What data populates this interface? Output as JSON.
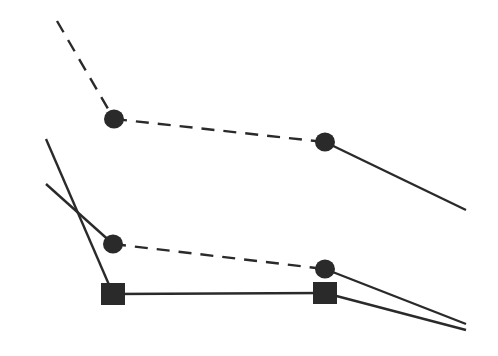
{
  "diagram": {
    "background": "#ffffff",
    "stroke_color": "#2a2a2a",
    "marker_color": "#2a2a2a",
    "stroke_width": 2.4,
    "dash_pattern": "13,9",
    "series": [
      {
        "name": "upper-circle-series",
        "marker": "circle",
        "segments": [
          {
            "from": [
              57,
              21
            ],
            "to": [
              114,
              119
            ],
            "style": "dashed"
          },
          {
            "from": [
              114,
              119
            ],
            "to": [
              325,
              142
            ],
            "style": "dashed"
          },
          {
            "from": [
              325,
              142
            ],
            "to": [
              466,
              210
            ],
            "style": "solid"
          }
        ],
        "markers": [
          [
            114,
            119
          ],
          [
            325,
            142
          ]
        ]
      },
      {
        "name": "lower-circle-series",
        "marker": "circle",
        "segments": [
          {
            "from": [
              46,
              184
            ],
            "to": [
              113,
              244
            ],
            "style": "solid"
          },
          {
            "from": [
              113,
              244
            ],
            "to": [
              325,
              269
            ],
            "style": "dashed"
          },
          {
            "from": [
              325,
              269
            ],
            "to": [
              466,
              324
            ],
            "style": "solid"
          }
        ],
        "markers": [
          [
            113,
            244
          ],
          [
            325,
            269
          ]
        ]
      },
      {
        "name": "square-series",
        "marker": "square",
        "segments": [
          {
            "from": [
              46,
              139
            ],
            "to": [
              113,
              294
            ],
            "style": "solid"
          },
          {
            "from": [
              113,
              294
            ],
            "to": [
              325,
              293
            ],
            "style": "solid"
          },
          {
            "from": [
              325,
              293
            ],
            "to": [
              466,
              330
            ],
            "style": "solid"
          }
        ],
        "markers": [
          [
            113,
            294
          ],
          [
            325,
            293
          ]
        ]
      }
    ]
  }
}
